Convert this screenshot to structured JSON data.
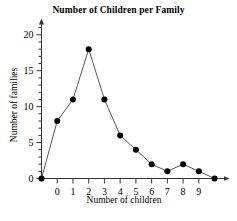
{
  "chart_data": {
    "type": "line",
    "title": "Number of Children per Family",
    "xlabel": "Number of children",
    "ylabel": "Number of families",
    "x": [
      0,
      1,
      2,
      3,
      4,
      5,
      6,
      7,
      8,
      9
    ],
    "values": [
      8,
      11,
      18,
      11,
      6,
      4,
      2,
      1,
      2,
      1
    ],
    "categories": [
      "0",
      "1",
      "2",
      "3",
      "4",
      "5",
      "6",
      "7",
      "8",
      "9"
    ],
    "endpoint_left": {
      "x": -1,
      "y": 0
    },
    "endpoint_right": {
      "x": 10,
      "y": 0
    },
    "xlim": [
      -1,
      10.6
    ],
    "ylim": [
      0,
      21.5
    ],
    "x_tick_labels": [
      "0",
      "1",
      "2",
      "3",
      "4",
      "5",
      "6",
      "7",
      "8",
      "9"
    ],
    "y_tick_labels": [
      "0",
      "5",
      "10",
      "15",
      "20"
    ],
    "y_major_ticks": [
      0,
      5,
      10,
      15,
      20
    ],
    "y_minor_tick_step": 1,
    "grid": false,
    "legend": null,
    "marker": "filled-circle",
    "marker_color": "#000000",
    "line_color": "#555555",
    "axis_color": "#333333",
    "axis_arrows": true
  }
}
